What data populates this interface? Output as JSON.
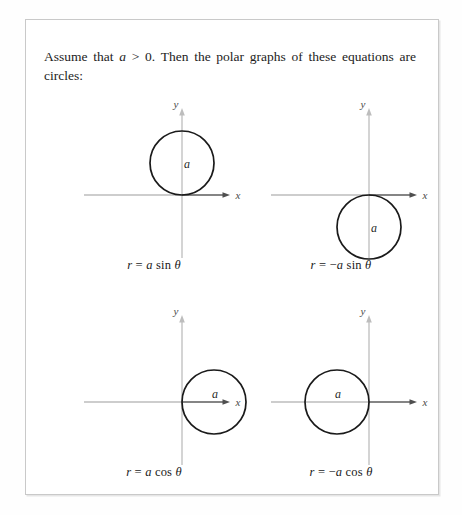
{
  "intro": {
    "text_before_var": "Assume that ",
    "variable": "a",
    "text_condition": " > 0. Then the polar graphs of these equations are circles:"
  },
  "axis_labels": {
    "x": "x",
    "y": "y"
  },
  "radius_label": "a",
  "figures": [
    {
      "id": "fig-a-sin-theta",
      "name": "circle-above-x-axis",
      "caption_r": "r",
      "caption_eq": " = ",
      "caption_sign": "",
      "caption_coef": "a",
      "caption_fn": " sin ",
      "caption_theta": "θ",
      "caption_full": "r = a sin θ",
      "circle": {
        "cx": 128,
        "cy": 65,
        "r": 32,
        "tangent": "origin-bottom"
      },
      "origin": {
        "x": 128,
        "y": 97
      }
    },
    {
      "id": "fig-neg-a-sin-theta",
      "name": "circle-below-x-axis",
      "caption_r": "r",
      "caption_eq": " = ",
      "caption_sign": "−",
      "caption_coef": "a",
      "caption_fn": " sin ",
      "caption_theta": "θ",
      "caption_full": "r = −a sin θ",
      "circle": {
        "cx": 128,
        "cy": 129,
        "r": 32,
        "tangent": "origin-top"
      },
      "origin": {
        "x": 128,
        "y": 97
      }
    },
    {
      "id": "fig-a-cos-theta",
      "name": "circle-right-of-y-axis",
      "caption_r": "r",
      "caption_eq": " = ",
      "caption_sign": "",
      "caption_coef": "a",
      "caption_fn": " cos ",
      "caption_theta": "θ",
      "caption_full": "r = a cos θ",
      "circle": {
        "cx": 160,
        "cy": 97,
        "r": 32,
        "tangent": "origin-left"
      },
      "origin": {
        "x": 128,
        "y": 97
      }
    },
    {
      "id": "fig-neg-a-cos-theta",
      "name": "circle-left-of-y-axis",
      "caption_r": "r",
      "caption_eq": " = ",
      "caption_sign": "−",
      "caption_coef": "a",
      "caption_fn": " cos ",
      "caption_theta": "θ",
      "caption_full": "r = −a cos θ",
      "circle": {
        "cx": 96,
        "cy": 97,
        "r": 32,
        "tangent": "origin-right"
      },
      "origin": {
        "x": 128,
        "y": 97
      }
    }
  ],
  "colors": {
    "page_background": "#fefefe",
    "panel_border": "#c9c9c9",
    "text": "#1c1c1c",
    "axis_light": "#b9b9b9",
    "axis_dark": "#6a6a6a",
    "curve": "#1a1a1a"
  }
}
